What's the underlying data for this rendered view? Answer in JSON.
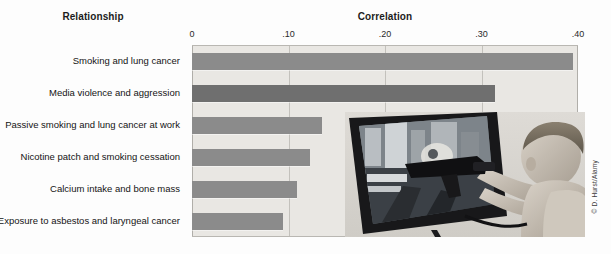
{
  "headings": {
    "relationship": "Relationship",
    "correlation": "Correlation"
  },
  "credit": "© D. Hurst/Alamy",
  "photo": {
    "alt_name": "child-playing-violent-video-game-photo",
    "description": "Black and white photo of a young child aiming a toy light gun at a television screen showing a violent video game"
  },
  "chart_data": {
    "type": "bar",
    "orientation": "horizontal",
    "title": "Correlation",
    "xlabel": "Correlation",
    "ylabel": "Relationship",
    "categories": [
      "Smoking and lung cancer",
      "Media violence and aggression",
      "Passive smoking and lung cancer at work",
      "Nicotine patch and smoking cessation",
      "Calcium intake and bone mass",
      "Exposure to asbestos and laryngeal cancer"
    ],
    "values": [
      0.395,
      0.314,
      0.135,
      0.122,
      0.109,
      0.094
    ],
    "xlim": [
      0,
      0.4
    ],
    "tick_values": [
      0,
      0.1,
      0.2,
      0.3,
      0.4
    ],
    "tick_labels": [
      "0",
      ".10",
      ".20",
      ".30",
      ".40"
    ],
    "grid": true,
    "legend": false,
    "bar_color": "#8b8b8b",
    "highlight_color": "#6f6f6f",
    "highlight_index": 1,
    "plot_background": "#e9e7e3"
  }
}
